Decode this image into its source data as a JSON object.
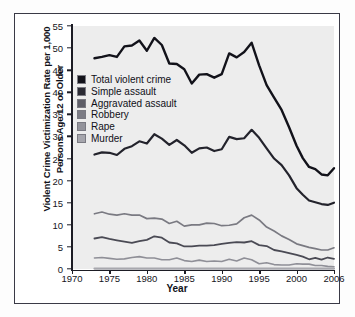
{
  "chart_data": {
    "type": "line",
    "title": "",
    "xlabel": "Year",
    "ylabel": "Violent Crime Victimization Rate per 1,000 Persons Age 12 or Older",
    "ylabel_line1": "Violent Crime Victimization Rate per 1,000",
    "ylabel_line2": "Persons Age 12 or Older",
    "xlim": [
      1970,
      2006
    ],
    "ylim": [
      0,
      55
    ],
    "grid": false,
    "legend_position": "upper-left-inside",
    "xticks": [
      1970,
      1975,
      1980,
      1985,
      1990,
      1995,
      2000,
      2006
    ],
    "xtick_labels": [
      "1970",
      "1975",
      "1980",
      "1985",
      "1990",
      "1995",
      "2000",
      "2006"
    ],
    "yticks": [
      0,
      5,
      10,
      15,
      20,
      25,
      30,
      35,
      40,
      45,
      50,
      55
    ],
    "ytick_labels": [
      "0",
      "5",
      "10",
      "15",
      "20",
      "25",
      "30",
      "35",
      "40",
      "45",
      "50",
      "55"
    ],
    "x": [
      1973,
      1974,
      1975,
      1976,
      1977,
      1978,
      1979,
      1980,
      1981,
      1982,
      1983,
      1984,
      1985,
      1986,
      1987,
      1988,
      1989,
      1990,
      1991,
      1992,
      1993,
      1994,
      1995,
      1996,
      1997,
      1998,
      1999,
      2000,
      2001,
      2002,
      2003,
      2004,
      2005,
      2006
    ],
    "series": [
      {
        "name": "Total violent crime",
        "color": "#12121a",
        "values": [
          47.7,
          48.0,
          48.4,
          48.0,
          50.4,
          50.6,
          51.7,
          49.4,
          52.3,
          50.7,
          46.5,
          46.4,
          45.2,
          42.0,
          44.0,
          44.1,
          43.3,
          44.1,
          48.8,
          47.9,
          49.1,
          51.2,
          46.1,
          41.6,
          38.8,
          36.0,
          32.1,
          27.9,
          25.1,
          23.1,
          22.6,
          21.4,
          21.2,
          22.8
        ]
      },
      {
        "name": "Simple assault",
        "color": "#23232c",
        "values": [
          25.9,
          26.4,
          26.3,
          25.8,
          27.2,
          27.8,
          28.9,
          28.4,
          30.5,
          29.5,
          28.1,
          29.2,
          28.0,
          26.3,
          27.3,
          27.5,
          26.7,
          27.1,
          29.9,
          29.4,
          29.6,
          31.5,
          29.7,
          27.3,
          25.0,
          23.5,
          21.2,
          18.3,
          16.8,
          15.5,
          15.1,
          14.7,
          14.5,
          15.0
        ]
      },
      {
        "name": "Aggravated assault",
        "color": "#7a7a82",
        "values": [
          12.5,
          12.9,
          12.4,
          12.2,
          12.5,
          12.2,
          12.2,
          11.4,
          11.5,
          11.3,
          10.3,
          10.8,
          9.7,
          10.0,
          10.0,
          10.4,
          10.3,
          9.8,
          9.9,
          10.2,
          11.6,
          12.2,
          11.1,
          9.5,
          8.6,
          7.5,
          6.7,
          5.7,
          5.3,
          4.9,
          4.6,
          4.3,
          4.3,
          4.8
        ]
      },
      {
        "name": "Robbery",
        "color": "#4a4a54"
      },
      {
        "name": "Rape",
        "color": "#8f8f97"
      },
      {
        "name": "Murder",
        "color": "#a8a8ae"
      }
    ],
    "series_extra": [
      {
        "name": "Robbery",
        "color": "#4a4a54",
        "values": [
          6.9,
          7.2,
          6.8,
          6.5,
          6.2,
          5.9,
          6.3,
          6.6,
          7.4,
          7.1,
          6.0,
          5.8,
          5.1,
          5.1,
          5.3,
          5.3,
          5.4,
          5.7,
          5.9,
          6.1,
          6.0,
          6.3,
          5.4,
          5.2,
          4.3,
          4.0,
          3.6,
          3.2,
          2.8,
          2.2,
          2.5,
          2.1,
          2.6,
          2.3
        ]
      },
      {
        "name": "Rape",
        "color": "#8f8f97",
        "values": [
          2.5,
          2.6,
          2.4,
          2.2,
          2.3,
          2.6,
          2.8,
          2.5,
          2.5,
          2.1,
          2.1,
          2.5,
          1.9,
          1.7,
          2.0,
          1.7,
          1.8,
          1.7,
          2.2,
          1.8,
          2.5,
          2.1,
          1.2,
          1.4,
          1.0,
          0.9,
          0.9,
          1.2,
          1.1,
          1.1,
          0.8,
          0.8,
          0.6,
          0.5
        ]
      },
      {
        "name": "Murder",
        "color": "#a8a8ae",
        "values": [
          0.1,
          0.1,
          0.1,
          0.1,
          0.1,
          0.1,
          0.1,
          0.1,
          0.1,
          0.1,
          0.1,
          0.1,
          0.1,
          0.1,
          0.1,
          0.1,
          0.1,
          0.1,
          0.1,
          0.1,
          0.1,
          0.1,
          0.1,
          0.1,
          0.1,
          0.1,
          0.1,
          0.1,
          0.1,
          0.1,
          0.1,
          0.1,
          0.1,
          0.1
        ]
      }
    ]
  },
  "legend": {
    "items": [
      {
        "label": "Total violent crime",
        "color": "#12121a"
      },
      {
        "label": "Simple assault",
        "color": "#2a2a33"
      },
      {
        "label": "Aggravated assault",
        "color": "#5e5e68"
      },
      {
        "label": "Robbery",
        "color": "#7c7c85"
      },
      {
        "label": "Rape",
        "color": "#93939b"
      },
      {
        "label": "Murder",
        "color": "#a6a6ad"
      }
    ]
  }
}
